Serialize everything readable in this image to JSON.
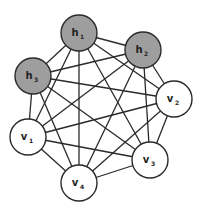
{
  "diagram": {
    "type": "complete-graph",
    "colors": {
      "hidden_fill": "#9e9e9e",
      "visible_fill": "#ffffff",
      "stroke": "#2a2a2a",
      "edge": "#2a2a2a"
    },
    "node_radius": 18,
    "nodes": [
      {
        "id": "h1",
        "base": "h",
        "sub": "1",
        "kind": "hidden",
        "x": 79,
        "y": 33
      },
      {
        "id": "h2",
        "base": "h",
        "sub": "2",
        "kind": "hidden",
        "x": 143,
        "y": 50
      },
      {
        "id": "h3",
        "base": "h",
        "sub": "3",
        "kind": "hidden",
        "x": 33,
        "y": 76
      },
      {
        "id": "v2",
        "base": "v",
        "sub": "2",
        "kind": "visible",
        "x": 174,
        "y": 99
      },
      {
        "id": "v1",
        "base": "v",
        "sub": "1",
        "kind": "visible",
        "x": 28,
        "y": 137
      },
      {
        "id": "v3",
        "base": "v",
        "sub": "3",
        "kind": "visible",
        "x": 150,
        "y": 160
      },
      {
        "id": "v4",
        "base": "v",
        "sub": "4",
        "kind": "visible",
        "x": 79,
        "y": 183
      }
    ],
    "edges": [
      [
        "h1",
        "h2"
      ],
      [
        "h1",
        "h3"
      ],
      [
        "h1",
        "v2"
      ],
      [
        "h1",
        "v1"
      ],
      [
        "h1",
        "v3"
      ],
      [
        "h1",
        "v4"
      ],
      [
        "h2",
        "h3"
      ],
      [
        "h2",
        "v2"
      ],
      [
        "h2",
        "v1"
      ],
      [
        "h2",
        "v3"
      ],
      [
        "h2",
        "v4"
      ],
      [
        "h3",
        "v2"
      ],
      [
        "h3",
        "v1"
      ],
      [
        "h3",
        "v3"
      ],
      [
        "h3",
        "v4"
      ],
      [
        "v2",
        "v1"
      ],
      [
        "v2",
        "v3"
      ],
      [
        "v2",
        "v4"
      ],
      [
        "v1",
        "v3"
      ],
      [
        "v1",
        "v4"
      ],
      [
        "v3",
        "v4"
      ]
    ]
  }
}
